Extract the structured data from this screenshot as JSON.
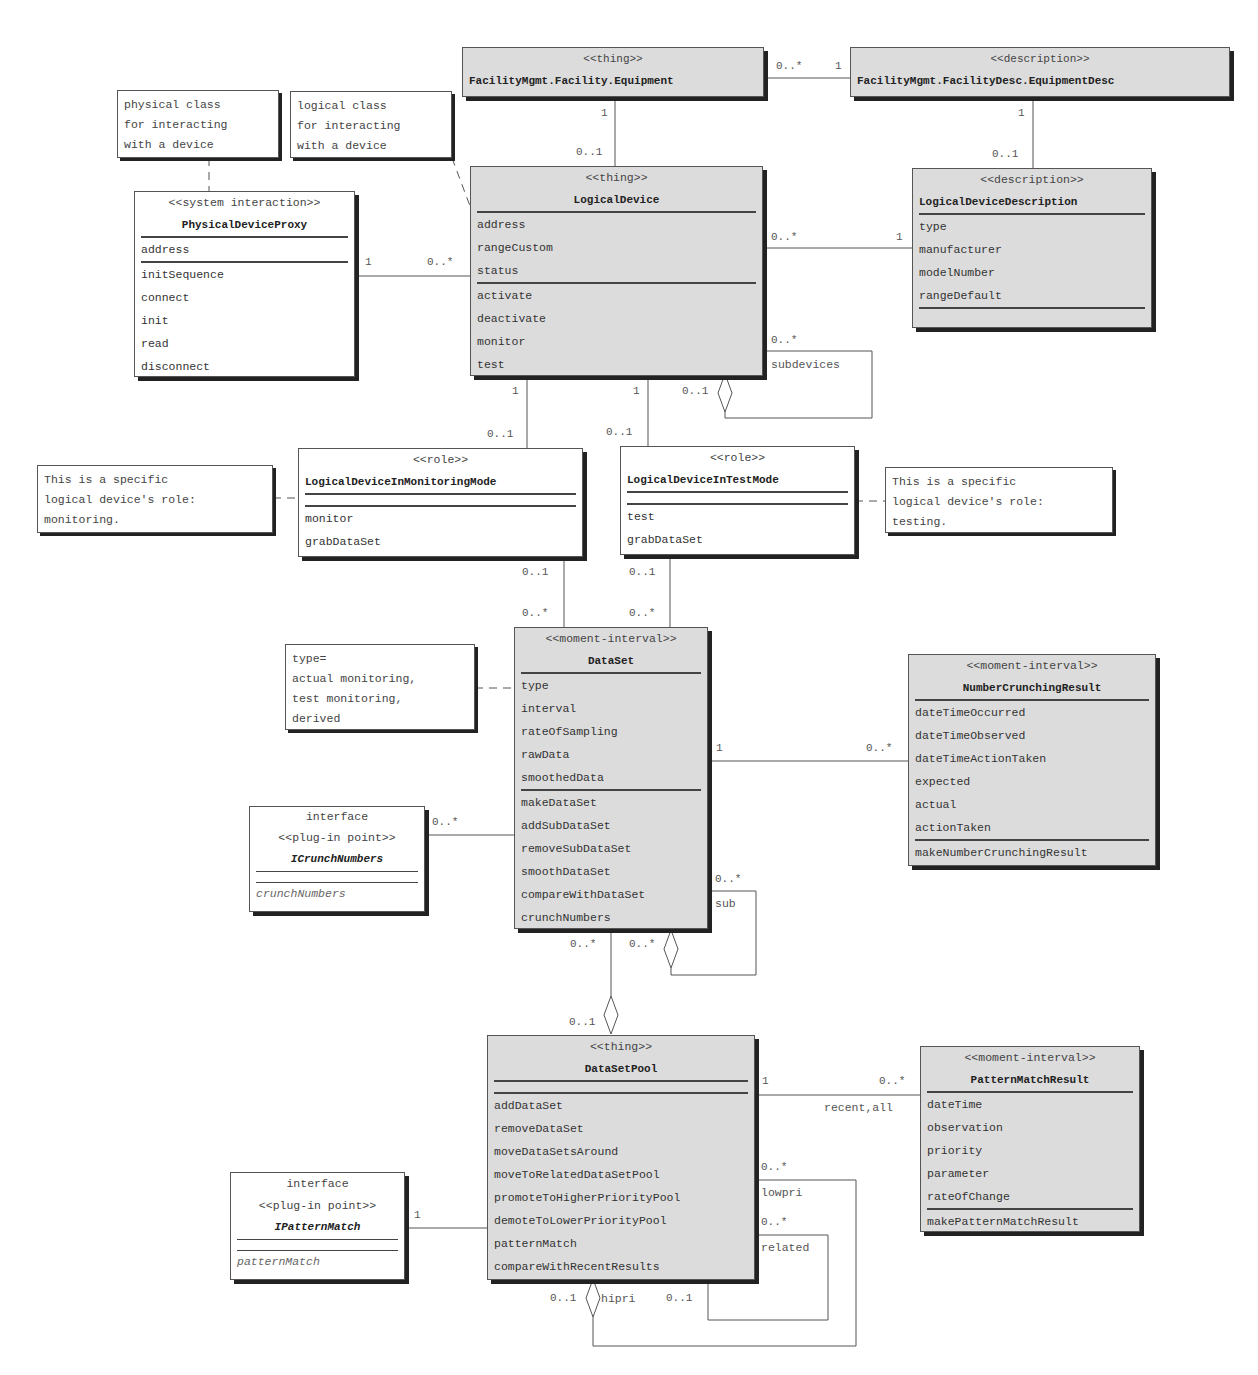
{
  "tags": {
    "equipment": {
      "stereotype": "<<thing>>",
      "name": "FacilityMgmt.Facility.Equipment"
    },
    "equipment_desc": {
      "stereotype": "<<description>>",
      "name": "FacilityMgmt.FacilityDesc.EquipmentDesc"
    }
  },
  "notes": {
    "physical": [
      "physical class",
      "for interacting",
      "with a device"
    ],
    "logical": [
      "logical class",
      "for interacting",
      "with a device"
    ],
    "monitoring": [
      "This is a specific",
      "logical device's role:",
      "monitoring."
    ],
    "testing": [
      "This is a specific",
      "logical device's role:",
      "testing."
    ],
    "type": [
      "type=",
      "actual monitoring,",
      "test monitoring,",
      "derived"
    ]
  },
  "classes": {
    "physical_device_proxy": {
      "stereotype": "<<system interaction>>",
      "name": "PhysicalDeviceProxy",
      "attributes": [
        "address"
      ],
      "operations": [
        "initSequence",
        "connect",
        "init",
        "read",
        "disconnect"
      ]
    },
    "logical_device": {
      "stereotype": "<<thing>>",
      "name": "LogicalDevice",
      "attributes": [
        "address",
        "rangeCustom",
        "status"
      ],
      "operations": [
        "activate",
        "deactivate",
        "monitor",
        "test"
      ]
    },
    "logical_device_description": {
      "stereotype": "<<description>>",
      "name": "LogicalDeviceDescription",
      "attributes": [
        "type",
        "manufacturer",
        "modelNumber",
        "rangeDefault"
      ],
      "operations": []
    },
    "monitoring_mode": {
      "stereotype": "<<role>>",
      "name": "LogicalDeviceInMonitoringMode",
      "attributes": [],
      "operations": [
        "monitor",
        "grabDataSet"
      ]
    },
    "test_mode": {
      "stereotype": "<<role>>",
      "name": "LogicalDeviceInTestMode",
      "attributes": [],
      "operations": [
        "test",
        "grabDataSet"
      ]
    },
    "dataset": {
      "stereotype": "<<moment-interval>>",
      "name": "DataSet",
      "attributes": [
        "type",
        "interval",
        "rateOfSampling",
        "rawData",
        "smoothedData"
      ],
      "operations": [
        "makeDataSet",
        "addSubDataSet",
        "removeSubDataSet",
        "smoothDataSet",
        "compareWithDataSet",
        "crunchNumbers"
      ]
    },
    "number_crunching_result": {
      "stereotype": "<<moment-interval>>",
      "name": "NumberCrunchingResult",
      "attributes": [
        "dateTimeOccurred",
        "dateTimeObserved",
        "dateTimeActionTaken",
        "expected",
        "actual",
        "actionTaken"
      ],
      "operations": [
        "makeNumberCrunchingResult"
      ]
    },
    "icrunch_numbers": {
      "kind": "interface",
      "stereotype": "<<plug-in point>>",
      "name": "ICrunchNumbers",
      "operations": [
        "crunchNumbers"
      ]
    },
    "dataset_pool": {
      "stereotype": "<<thing>>",
      "name": "DataSetPool",
      "attributes": [],
      "operations": [
        "addDataSet",
        "removeDataSet",
        "moveDataSetsAround",
        "moveToRelatedDataSetPool",
        "promoteToHigherPriorityPool",
        "demoteToLowerPriorityPool",
        "patternMatch",
        "compareWithRecentResults"
      ]
    },
    "pattern_match_result": {
      "stereotype": "<<moment-interval>>",
      "name": "PatternMatchResult",
      "attributes": [
        "dateTime",
        "observation",
        "priority",
        "parameter",
        "rateOfChange"
      ],
      "operations": [
        "makePatternMatchResult"
      ]
    },
    "ipattern_match": {
      "kind": "interface",
      "stereotype": "<<plug-in point>>",
      "name": "IPatternMatch",
      "operations": [
        "patternMatch"
      ]
    }
  },
  "multiplicities": {
    "eq_desc_left": "0..*",
    "eq_desc_right": "1",
    "eq_ld_top": "1",
    "eq_ld_bottom": "0..1",
    "eqd_ldd_top": "1",
    "eqd_ldd_bottom": "0..1",
    "pdp_ld_left": "1",
    "pdp_ld_right": "0..*",
    "ld_ldd_left": "0..*",
    "ld_ldd_right": "1",
    "ld_sub_many": "0..*",
    "ld_sub_one": "0..1",
    "ld_sub_label": "subdevices",
    "ld_mon_top": "1",
    "ld_mon_bottom": "0..1",
    "ld_test_top": "1",
    "ld_test_bottom": "0..1",
    "mon_ds_top": "0..1",
    "mon_ds_bottom": "0..*",
    "test_ds_top": "0..1",
    "test_ds_bottom": "0..*",
    "ds_ncr_left": "1",
    "ds_ncr_right": "0..*",
    "icn_ds": "0..*",
    "ds_sub_many": "0..*",
    "ds_sub_one": "0..*",
    "ds_sub_label": "sub",
    "ds_pool_top": "0..*",
    "ds_pool_bottom": "0..1",
    "pool_pmr_left": "1",
    "pool_pmr_right": "0..*",
    "pool_pmr_label": "recent,all",
    "ipm_pool": "1",
    "pool_lowpri": "0..*",
    "pool_lowpri_label": "lowpri",
    "pool_related": "0..*",
    "pool_related_label": "related",
    "pool_hipri_one": "0..1",
    "pool_hipri_label": "hipri",
    "pool_related_one": "0..1"
  }
}
